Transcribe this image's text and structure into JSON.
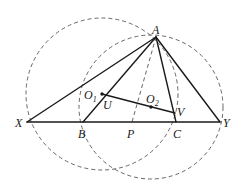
{
  "diagram": {
    "points": {
      "A": {
        "label": "A"
      },
      "X": {
        "label": "X"
      },
      "Y": {
        "label": "Y"
      },
      "B": {
        "label": "B"
      },
      "P": {
        "label": "P"
      },
      "C": {
        "label": "C"
      },
      "U": {
        "label": "U"
      },
      "V": {
        "label": "V"
      },
      "O1": {
        "label": "O",
        "subscript": "1"
      },
      "O2": {
        "label": "O",
        "subscript": "2"
      }
    },
    "solid_segments": [
      "AX",
      "AB",
      "AC",
      "AY",
      "XY",
      "O1V"
    ],
    "dashed_segments": [
      "AP"
    ],
    "dashed_circles": [
      "circle centered O1 through A, X, B",
      "circle centered O2 through A, C, Y"
    ],
    "marked_points": [
      "O1",
      "O2"
    ],
    "line_color": "#1a1a1a",
    "dash_color": "#555555"
  }
}
